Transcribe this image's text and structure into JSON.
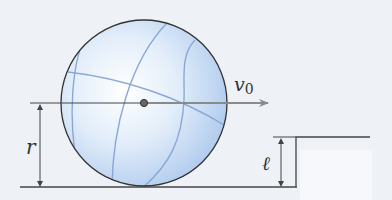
{
  "figure": {
    "type": "physics-diagram",
    "labels": {
      "velocity": "v",
      "velocity_subscript": "0",
      "radius": "r",
      "step_height": "ℓ"
    },
    "colors": {
      "background": "#eef1f6",
      "sphere_fill": "#cfe0f5",
      "sphere_highlight": "#ffffff",
      "seam": "#8aa8d6",
      "outline": "#333333",
      "arrow": "#8a8a8a"
    }
  }
}
